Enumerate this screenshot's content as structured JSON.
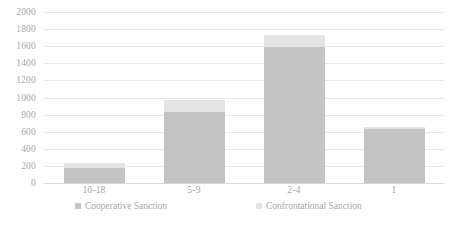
{
  "chart_data": {
    "type": "bar",
    "barmode": "stacked",
    "title": "",
    "xlabel": "",
    "ylabel": "",
    "categories": [
      "10-18",
      "5-9",
      "2-4",
      "1"
    ],
    "series": [
      {
        "name": "Cooperative Sanction",
        "color": "#c4c4c4",
        "values": [
          175,
          830,
          1590,
          630
        ]
      },
      {
        "name": "Confrontational Sanction",
        "color": "#e4e4e4",
        "values": [
          60,
          140,
          140,
          25
        ]
      }
    ],
    "totals": [
      235,
      970,
      1730,
      655
    ],
    "ylim": [
      0,
      2000
    ],
    "ytick_step": 200,
    "yticks": [
      "2000",
      "1800",
      "1600",
      "1400",
      "1200",
      "1000",
      "800",
      "600",
      "400",
      "200",
      "0"
    ],
    "grid": true,
    "grid_axis": "y",
    "legend_position": "bottom",
    "legend": [
      {
        "label": "Cooperative Sanction",
        "swatch": "#c4c4c4"
      },
      {
        "label": "Confrontational Sanction",
        "swatch": "#e4e4e4"
      }
    ]
  }
}
